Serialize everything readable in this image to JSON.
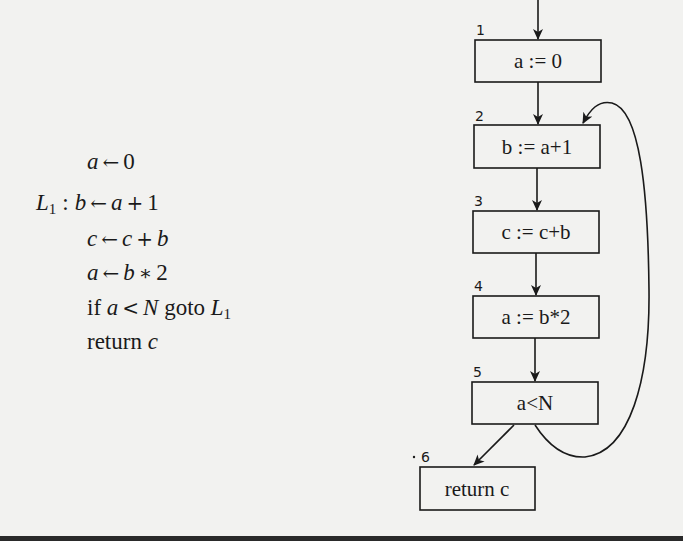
{
  "code": {
    "lines": [
      {
        "label": "",
        "parts": [
          {
            "t": "a",
            "i": true
          },
          {
            "t": "←",
            "op": true
          },
          {
            "t": "0"
          }
        ]
      },
      {
        "label": "L",
        "label_sub": "1",
        "parts": [
          {
            "t": "b",
            "i": true
          },
          {
            "t": "←",
            "op": true
          },
          {
            "t": "a",
            "i": true
          },
          {
            "t": "+",
            "op": true
          },
          {
            "t": "1"
          }
        ]
      },
      {
        "label": "",
        "parts": [
          {
            "t": "c",
            "i": true
          },
          {
            "t": "←",
            "op": true
          },
          {
            "t": "c",
            "i": true
          },
          {
            "t": "+",
            "op": true
          },
          {
            "t": "b",
            "i": true
          }
        ]
      },
      {
        "label": "",
        "parts": [
          {
            "t": "a",
            "i": true
          },
          {
            "t": "←",
            "op": true
          },
          {
            "t": "b",
            "i": true
          },
          {
            "t": "∗",
            "op": true
          },
          {
            "t": "2"
          }
        ]
      },
      {
        "label": "",
        "parts": [
          {
            "t": "if "
          },
          {
            "t": "a",
            "i": true
          },
          {
            "t": "<",
            "op": true
          },
          {
            "t": "N",
            "i": true
          },
          {
            "t": " goto "
          },
          {
            "t": "L",
            "i": true,
            "sub": "1"
          }
        ]
      },
      {
        "label": "",
        "parts": [
          {
            "t": "return "
          },
          {
            "t": "c",
            "i": true
          }
        ]
      }
    ],
    "text_lines": [
      "a ← 0",
      "L1 : b ← a + 1",
      "c ← c + b",
      "a ← b * 2",
      "if a < N goto L1",
      "return c"
    ]
  },
  "graph": {
    "nodes": [
      {
        "id": "1",
        "number": "1",
        "label": "a := 0"
      },
      {
        "id": "2",
        "number": "2",
        "label": "b := a+1"
      },
      {
        "id": "3",
        "number": "3",
        "label": "c := c+b"
      },
      {
        "id": "4",
        "number": "4",
        "label": "a := b*2"
      },
      {
        "id": "5",
        "number": "5",
        "label": "a<N"
      },
      {
        "id": "6",
        "number": "6",
        "label": "return c"
      }
    ],
    "edges": [
      {
        "from": "entry",
        "to": "1"
      },
      {
        "from": "1",
        "to": "2"
      },
      {
        "from": "2",
        "to": "3"
      },
      {
        "from": "3",
        "to": "4"
      },
      {
        "from": "4",
        "to": "5"
      },
      {
        "from": "5",
        "to": "6"
      },
      {
        "from": "5",
        "to": "2",
        "type": "back-edge"
      }
    ]
  }
}
